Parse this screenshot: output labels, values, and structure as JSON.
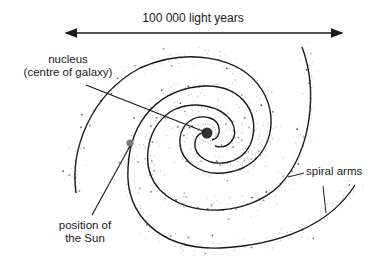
{
  "figure": {
    "scale_label": "100 000 light years",
    "labels": {
      "nucleus_line1": "nucleus",
      "nucleus_line2": "(centre of galaxy)",
      "sun_line1": "position of",
      "sun_line2": "the Sun",
      "spiral_arms": "spiral arms"
    },
    "colors": {
      "ink": "#1a1a1a",
      "sun": "#7a7a7a",
      "nucleus": "#333333",
      "stars": "#444444"
    },
    "positions": {
      "nucleus": [
        207,
        133
      ],
      "sun": [
        130,
        143
      ],
      "scale_arrow": [
        [
          65,
          33
        ],
        [
          343,
          33
        ]
      ]
    }
  }
}
